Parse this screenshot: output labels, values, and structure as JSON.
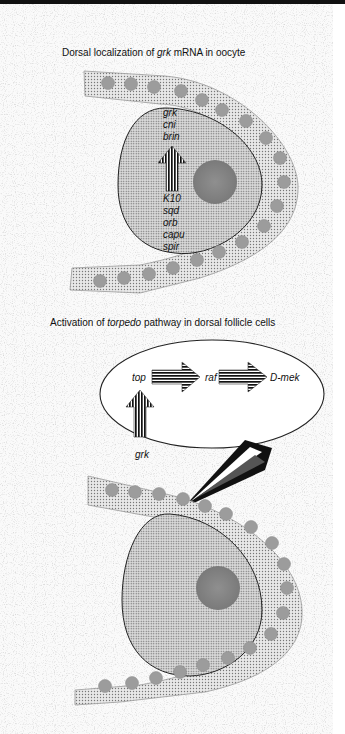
{
  "panel_top": {
    "title_prefix": "Dorsal localization of ",
    "title_italic": "grk",
    "title_suffix": " mRNA in oocyte",
    "genes_above_arrow": [
      "grk",
      "cni",
      "brin"
    ],
    "genes_below_arrow": [
      "K10",
      "sqd",
      "orb",
      "capu",
      "spir"
    ]
  },
  "panel_bottom": {
    "title_prefix": "Activation of ",
    "title_italic": "torpedo",
    "title_suffix": " pathway in dorsal follicle cells",
    "pathway": {
      "input": "grk",
      "step1": "top",
      "step2": "raf",
      "step3": "D-mek"
    }
  },
  "colors": {
    "background": "#ffffff",
    "noise": "#b8b8b8",
    "follicle_fill": "#d4d4d4",
    "oocyte_fill": "#e2e2e2",
    "nucleus_fill": "#8a8a8a",
    "cell_dot": "#9a9a9a",
    "outline": "#222222"
  }
}
